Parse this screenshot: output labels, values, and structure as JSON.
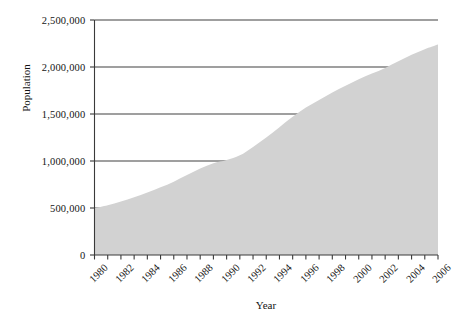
{
  "chart_data": {
    "type": "area",
    "title": "",
    "xlabel": "Year",
    "ylabel": "Population",
    "xlim": [
      1980,
      2006
    ],
    "ylim": [
      0,
      2500000
    ],
    "grid": true,
    "legend": null,
    "fill_color": "#d2d2d2",
    "axis_color": "#3a3a3a",
    "gridline_color": "#404040",
    "y_ticks": [
      0,
      500000,
      1000000,
      1500000,
      2000000,
      2500000
    ],
    "y_tick_labels": [
      "0",
      "500,000",
      "1,000,000",
      "1,500,000",
      "2,000,000",
      "2,500,000"
    ],
    "x_ticks": [
      1980,
      1981,
      1982,
      1983,
      1984,
      1985,
      1986,
      1987,
      1988,
      1989,
      1990,
      1991,
      1992,
      1993,
      1994,
      1995,
      1996,
      1997,
      1998,
      1999,
      2000,
      2001,
      2002,
      2003,
      2004,
      2005,
      2006
    ],
    "x_tick_labels": [
      "1980",
      "1982",
      "1984",
      "1986",
      "1988",
      "1990",
      "1992",
      "1994",
      "1996",
      "1998",
      "2000",
      "2002",
      "2004",
      "2006"
    ],
    "x_tick_label_years": [
      1980,
      1982,
      1984,
      1986,
      1988,
      1990,
      1992,
      1994,
      1996,
      1998,
      2000,
      2002,
      2004,
      2006
    ],
    "x": [
      1980,
      1981,
      1982,
      1983,
      1984,
      1985,
      1986,
      1987,
      1988,
      1989,
      1990,
      1991,
      1992,
      1993,
      1994,
      1995,
      1996,
      1997,
      1998,
      1999,
      2000,
      2001,
      2002,
      2003,
      2004,
      2005,
      2006
    ],
    "values": [
      500000,
      530000,
      570000,
      615000,
      665000,
      720000,
      780000,
      850000,
      920000,
      975000,
      1010000,
      1060000,
      1150000,
      1250000,
      1360000,
      1470000,
      1570000,
      1650000,
      1730000,
      1800000,
      1870000,
      1930000,
      1990000,
      2060000,
      2130000,
      2190000,
      2240000
    ]
  }
}
